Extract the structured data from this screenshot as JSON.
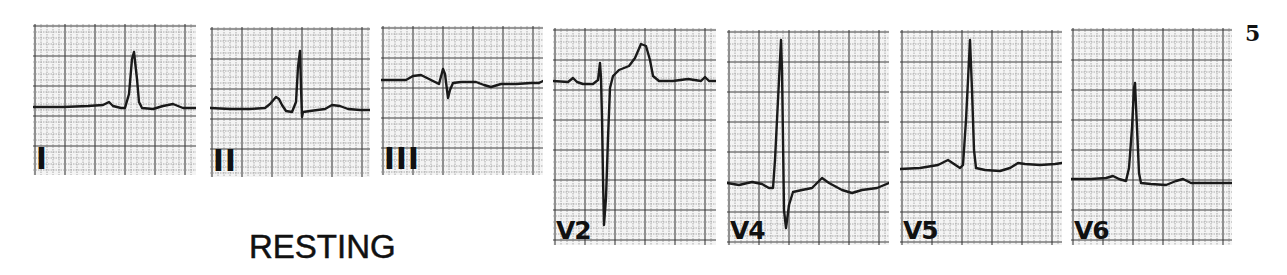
{
  "figure": {
    "number": "5",
    "caption": "RESTING"
  },
  "style": {
    "trace_color": "#1a1a1a",
    "grid_minor_color": "#9a9a9a",
    "grid_major_color": "#3c3c3c",
    "paper_color": "#f4f4f4"
  },
  "leads": [
    {
      "label": "I",
      "box": {
        "x": 33,
        "y": 24,
        "w": 163,
        "h": 151
      },
      "trace": "0,83 30,83 55,82 70,81 76,78 80,82 88,84 92,84 96,70 99,35 101,28 104,55 106,78 109,84 120,85 130,82 140,80 150,84 163,84"
    },
    {
      "label": "II",
      "box": {
        "x": 210,
        "y": 27,
        "w": 160,
        "h": 150
      },
      "trace": "0,81 20,82 40,82 55,81 60,77 66,70 69,72 72,78 76,84 82,85 86,75 88,40 90,24 91,60 92,90 93,85 100,84 115,82 122,78 130,79 138,82 150,83 160,83"
    },
    {
      "label": "III",
      "box": {
        "x": 381,
        "y": 26,
        "w": 162,
        "h": 149
      },
      "trace": "0,54 25,54 32,50 40,49 48,53 54,56 58,58 62,43 64,48 67,72 69,64 72,57 80,56 95,56 103,59 110,61 120,58 135,58 150,57 158,57 162,55"
    },
    {
      "label": "V2",
      "box": {
        "x": 553,
        "y": 28,
        "w": 163,
        "h": 217
      },
      "trace": "0,53 15,54 20,50 24,54 30,56 40,56 45,52 47,35 48,50 49,90 50,150 51,197 53,170 55,110 57,60 60,48 66,42 76,38 82,30 88,16 93,18 97,32 100,48 106,53 120,53 135,51 148,53 152,49 156,53 163,53"
    },
    {
      "label": "V4",
      "box": {
        "x": 727,
        "y": 30,
        "w": 162,
        "h": 215
      },
      "trace": "0,153 12,155 25,152 35,154 42,158 46,158 48,130 51,70 54,10 55,40 56,110 57,180 59,198 62,175 66,162 75,160 85,158 95,148 102,153 115,160 125,163 135,160 150,158 162,153"
    },
    {
      "label": "V5",
      "box": {
        "x": 900,
        "y": 30,
        "w": 162,
        "h": 215
      },
      "trace": "0,139 20,138 38,135 48,130 54,134 60,138 63,135 66,90 69,30 70,10 72,60 74,120 76,138 85,140 100,141 110,138 118,133 125,134 140,135 155,134 162,133"
    },
    {
      "label": "V6",
      "box": {
        "x": 1071,
        "y": 28,
        "w": 161,
        "h": 217
      },
      "trace": "0,151 20,151 35,150 42,148 48,151 55,153 58,140 61,100 63,60 64,55 66,100 68,145 70,155 80,156 95,157 105,153 112,151 120,155 140,155 161,155"
    }
  ]
}
